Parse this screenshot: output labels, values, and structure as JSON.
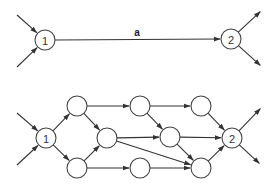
{
  "diagrams": [
    {
      "id": "top",
      "nodes": [
        {
          "id": "n1",
          "x": 45,
          "y": 40,
          "r": 10,
          "label": "1"
        },
        {
          "id": "n2",
          "x": 231,
          "y": 39,
          "r": 10,
          "label": "2"
        }
      ],
      "edges": [
        {
          "from": [
            17,
            15
          ],
          "to": "n1"
        },
        {
          "from": [
            17,
            67
          ],
          "to": "n1"
        },
        {
          "from": "n1",
          "to": "n2",
          "label": "a",
          "label_pos": [
            137,
            36
          ]
        },
        {
          "from": "n2",
          "to": [
            261,
            11
          ]
        },
        {
          "from": "n2",
          "to": [
            261,
            66
          ]
        }
      ]
    },
    {
      "id": "bottom",
      "nodes": [
        {
          "id": "b1",
          "x": 46,
          "y": 138,
          "r": 10,
          "label": "1"
        },
        {
          "id": "bA",
          "x": 77,
          "y": 106,
          "r": 10,
          "label": ""
        },
        {
          "id": "bC",
          "x": 77,
          "y": 168,
          "r": 10,
          "label": ""
        },
        {
          "id": "bB",
          "x": 107,
          "y": 138,
          "r": 10,
          "label": ""
        },
        {
          "id": "bD",
          "x": 140,
          "y": 106,
          "r": 10,
          "label": ""
        },
        {
          "id": "bE",
          "x": 140,
          "y": 168,
          "r": 10,
          "label": ""
        },
        {
          "id": "bF",
          "x": 170,
          "y": 137,
          "r": 10,
          "label": ""
        },
        {
          "id": "bG",
          "x": 201,
          "y": 106,
          "r": 10,
          "label": ""
        },
        {
          "id": "bH",
          "x": 201,
          "y": 168,
          "r": 10,
          "label": ""
        },
        {
          "id": "b2",
          "x": 232,
          "y": 138,
          "r": 10,
          "label": "2"
        }
      ],
      "edges": [
        {
          "from": [
            17,
            113
          ],
          "to": "b1"
        },
        {
          "from": [
            17,
            165
          ],
          "to": "b1"
        },
        {
          "from": "b1",
          "to": "bA"
        },
        {
          "from": "b1",
          "to": "bC"
        },
        {
          "from": "bA",
          "to": "bD"
        },
        {
          "from": "bA",
          "to": "bB"
        },
        {
          "from": "bC",
          "to": "bB"
        },
        {
          "from": "bC",
          "to": "bE"
        },
        {
          "from": "bB",
          "to": "bF"
        },
        {
          "from": "bB",
          "to": "bH"
        },
        {
          "from": "bD",
          "to": "bG"
        },
        {
          "from": "bD",
          "to": "bF"
        },
        {
          "from": "bE",
          "to": "bH"
        },
        {
          "from": "bF",
          "to": "bH"
        },
        {
          "from": "bF",
          "to": "b2"
        },
        {
          "from": "bG",
          "to": "b2"
        },
        {
          "from": "bH",
          "to": "b2"
        },
        {
          "from": "b2",
          "to": [
            261,
            108
          ]
        },
        {
          "from": "b2",
          "to": [
            260,
            164
          ]
        }
      ]
    }
  ]
}
